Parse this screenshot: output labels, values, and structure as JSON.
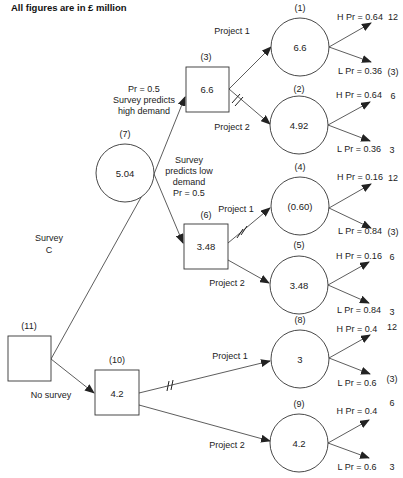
{
  "title": "All figures are in £ million",
  "decision_nodes": [
    {
      "id": "11",
      "label": "(11)",
      "value": ""
    },
    {
      "id": "10",
      "label": "(10)",
      "value": "4.2"
    },
    {
      "id": "3",
      "label": "(3)",
      "value": "6.6"
    },
    {
      "id": "6",
      "label": "(6)",
      "value": "3.48"
    }
  ],
  "chance_nodes": [
    {
      "id": "7",
      "label": "(7)",
      "value": "5.04"
    },
    {
      "id": "1",
      "label": "(1)",
      "value": "6.6"
    },
    {
      "id": "2",
      "label": "(2)",
      "value": "4.92"
    },
    {
      "id": "4",
      "label": "(4)",
      "value": "(0.60)"
    },
    {
      "id": "5",
      "label": "(5)",
      "value": "3.48"
    },
    {
      "id": "8",
      "label": "(8)",
      "value": "3"
    },
    {
      "id": "9",
      "label": "(9)",
      "value": "4.2"
    }
  ],
  "branch_labels": {
    "survey": [
      "Survey",
      "C"
    ],
    "no_survey": "No survey",
    "high_demand": [
      "Pr = 0.5",
      "Survey predicts",
      "high demand"
    ],
    "low_demand": [
      "Survey",
      "predicts low",
      "demand",
      "Pr = 0.5"
    ],
    "project1": "Project 1",
    "project2": "Project 2"
  },
  "outcomes": [
    {
      "node": "1",
      "h_label": "H Pr = 0.64",
      "h_payoff": "12",
      "l_label": "L Pr = 0.36",
      "l_payoff": "(3)"
    },
    {
      "node": "2",
      "h_label": "H Pr = 0.64",
      "h_payoff": "6",
      "l_label": "L Pr = 0.36",
      "l_payoff": "3"
    },
    {
      "node": "4",
      "h_label": "H Pr = 0.16",
      "h_payoff": "12",
      "l_label": "L Pr = 0.84",
      "l_payoff": "(3)"
    },
    {
      "node": "5",
      "h_label": "H Pr = 0.16",
      "h_payoff": "6",
      "l_label": "L Pr = 0.84",
      "l_payoff": "3"
    },
    {
      "node": "8",
      "h_label": "H Pr = 0.4",
      "h_payoff": "12",
      "l_label": "L Pr = 0.6",
      "l_payoff": "(3)"
    },
    {
      "node": "9",
      "h_label": "H Pr = 0.4",
      "h_payoff": "6",
      "l_label": "L Pr = 0.6",
      "l_payoff": "3"
    }
  ]
}
